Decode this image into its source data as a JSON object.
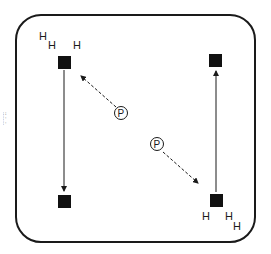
{
  "diagram": {
    "type": "structure-schematic",
    "side_text": "::.:..:.",
    "nodes": [
      {
        "id": "top-left",
        "shape": "square",
        "labels": [
          "H",
          "H",
          "H"
        ]
      },
      {
        "id": "bottom-left",
        "shape": "square",
        "labels": []
      },
      {
        "id": "top-right",
        "shape": "square",
        "labels": []
      },
      {
        "id": "bottom-right",
        "shape": "square",
        "labels": [
          "H",
          "H",
          "H"
        ]
      }
    ],
    "p_labels": [
      "P",
      "P"
    ],
    "top_left_labels": {
      "h1": "H",
      "h2": "H",
      "h3": "H"
    },
    "bottom_right_labels": {
      "h1": "H",
      "h2": "H",
      "h3": "H"
    },
    "edges": [
      {
        "from": "top-left",
        "to": "bottom-left",
        "style": "solid",
        "arrow": "end"
      },
      {
        "from": "bottom-right",
        "to": "top-right",
        "style": "solid",
        "arrow": "end"
      },
      {
        "from": "P-upper",
        "to": "top-left",
        "style": "dashed",
        "arrow": "end"
      },
      {
        "from": "P-lower",
        "to": "bottom-right",
        "style": "dashed",
        "arrow": "end"
      }
    ],
    "colors": {
      "stroke": "#1a1a1a",
      "fill": "#111111",
      "background": "#ffffff"
    }
  }
}
